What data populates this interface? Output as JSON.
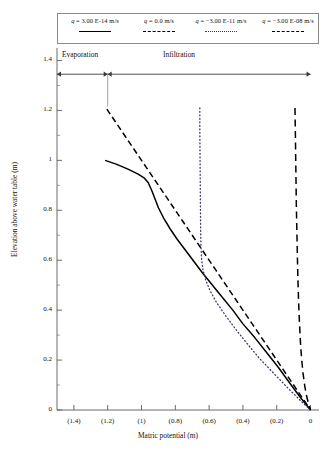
{
  "chart_data": {
    "type": "line",
    "title": "",
    "xlabel": "Matric potential (m)",
    "ylabel": "Elevation above water table (m)",
    "xlim": [
      -1.5,
      0.05
    ],
    "ylim": [
      0,
      1.45
    ],
    "grid": false,
    "legend_position": "top",
    "x_ticks": [
      "(1.4)",
      "(1.2)",
      "(1)",
      "(0.8)",
      "(0.6)",
      "(0.4)",
      "(0.2)",
      "0"
    ],
    "x_tick_values": [
      -1.4,
      -1.2,
      -1.0,
      -0.8,
      -0.6,
      -0.4,
      -0.2,
      0
    ],
    "y_ticks": [
      "0",
      "0.2",
      "0.4",
      "0.6",
      "0.8",
      "1",
      "1.2",
      "1.4"
    ],
    "y_tick_values": [
      0,
      0.2,
      0.4,
      0.6,
      0.8,
      1.0,
      1.2,
      1.4
    ],
    "y_minor_ticks": [
      0.1,
      0.3,
      0.5,
      0.7,
      0.9,
      1.1,
      1.3
    ],
    "annotations": [
      {
        "text": "Evaporation",
        "x_range": [
          -1.48,
          -1.2
        ],
        "y": 1.345,
        "arrow": "double"
      },
      {
        "text": "Infiltration",
        "x_range": [
          -1.2,
          0.0
        ],
        "y": 1.345,
        "arrow": "double"
      }
    ],
    "series": [
      {
        "name": "q = 3.00E-14 m/s",
        "style": "solid",
        "color": "#000000",
        "points": [
          [
            -1.215,
            1.0
          ],
          [
            -1.15,
            0.985
          ],
          [
            -1.08,
            0.965
          ],
          [
            -1.02,
            0.945
          ],
          [
            -0.985,
            0.93
          ],
          [
            -0.96,
            0.91
          ],
          [
            -0.94,
            0.88
          ],
          [
            -0.92,
            0.845
          ],
          [
            -0.9,
            0.81
          ],
          [
            -0.87,
            0.77
          ],
          [
            -0.83,
            0.725
          ],
          [
            -0.79,
            0.685
          ],
          [
            -0.74,
            0.64
          ],
          [
            -0.69,
            0.595
          ],
          [
            -0.64,
            0.55
          ],
          [
            -0.58,
            0.5
          ],
          [
            -0.52,
            0.45
          ],
          [
            -0.46,
            0.4
          ],
          [
            -0.4,
            0.345
          ],
          [
            -0.33,
            0.29
          ],
          [
            -0.26,
            0.23
          ],
          [
            -0.19,
            0.17
          ],
          [
            -0.12,
            0.105
          ],
          [
            -0.06,
            0.05
          ],
          [
            0.0,
            0.0
          ]
        ]
      },
      {
        "name": "q = 0.0 m/s",
        "style": "dashed",
        "color": "#000000",
        "points": [
          [
            -1.205,
            1.205
          ],
          [
            -1.15,
            1.15
          ],
          [
            -1.08,
            1.08
          ],
          [
            -1.01,
            1.01
          ],
          [
            -0.95,
            0.95
          ],
          [
            -0.88,
            0.88
          ],
          [
            -0.82,
            0.82
          ],
          [
            -0.755,
            0.755
          ],
          [
            -0.69,
            0.69
          ],
          [
            -0.625,
            0.625
          ],
          [
            -0.56,
            0.56
          ],
          [
            -0.495,
            0.495
          ],
          [
            -0.43,
            0.43
          ],
          [
            -0.36,
            0.36
          ],
          [
            -0.295,
            0.295
          ],
          [
            -0.23,
            0.23
          ],
          [
            -0.165,
            0.165
          ],
          [
            -0.1,
            0.1
          ],
          [
            -0.045,
            0.045
          ],
          [
            0.0,
            0.0
          ]
        ]
      },
      {
        "name": "q = −3.00E-11 m/s",
        "style": "dotted",
        "color": "#3a3a6e",
        "points": [
          [
            -0.655,
            1.21
          ],
          [
            -0.655,
            1.13
          ],
          [
            -0.654,
            1.04
          ],
          [
            -0.653,
            0.95
          ],
          [
            -0.652,
            0.86
          ],
          [
            -0.651,
            0.78
          ],
          [
            -0.65,
            0.71
          ],
          [
            -0.648,
            0.65
          ],
          [
            -0.644,
            0.6
          ],
          [
            -0.636,
            0.56
          ],
          [
            -0.62,
            0.52
          ],
          [
            -0.596,
            0.48
          ],
          [
            -0.56,
            0.435
          ],
          [
            -0.51,
            0.385
          ],
          [
            -0.45,
            0.33
          ],
          [
            -0.38,
            0.27
          ],
          [
            -0.3,
            0.205
          ],
          [
            -0.215,
            0.145
          ],
          [
            -0.13,
            0.085
          ],
          [
            -0.06,
            0.038
          ],
          [
            0.0,
            0.0
          ]
        ]
      },
      {
        "name": "q = −3.00E-08 m/s",
        "style": "longdash",
        "color": "#000000",
        "points": [
          [
            -0.092,
            1.21
          ],
          [
            -0.09,
            1.12
          ],
          [
            -0.088,
            1.02
          ],
          [
            -0.086,
            0.92
          ],
          [
            -0.084,
            0.82
          ],
          [
            -0.081,
            0.72
          ],
          [
            -0.078,
            0.62
          ],
          [
            -0.075,
            0.53
          ],
          [
            -0.071,
            0.44
          ],
          [
            -0.066,
            0.355
          ],
          [
            -0.06,
            0.275
          ],
          [
            -0.053,
            0.205
          ],
          [
            -0.044,
            0.145
          ],
          [
            -0.034,
            0.095
          ],
          [
            -0.022,
            0.052
          ],
          [
            -0.01,
            0.02
          ],
          [
            0.0,
            0.0
          ]
        ]
      }
    ]
  },
  "legend": {
    "items": [
      {
        "label": "q = 3.00E-14 m/s",
        "q": "q",
        "rest": " = 3.00 E-14 m/s",
        "style": "solid"
      },
      {
        "label": "q = 0.0 m/s",
        "q": "q",
        "rest": " = 0.0 m/s",
        "style": "dash"
      },
      {
        "label": "q = −3.00E-11 m/s",
        "q": "q",
        "rest": " = −3.00 E-11 m/s",
        "style": "dot"
      },
      {
        "label": "q = −3.00E-08 m/s",
        "q": "q",
        "rest": " = −3.00 E-08 m/s",
        "style": "longdash"
      }
    ]
  },
  "zones": {
    "evaporation": "Evaporation",
    "infiltration": "Infiltration"
  },
  "axes": {
    "x_title": "Matric potential (m)",
    "y_title": "Elevation above water table (m)"
  }
}
